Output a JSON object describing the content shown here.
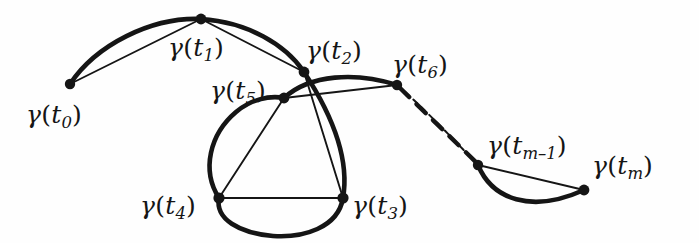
{
  "figure": {
    "name": "polygonal-approximation-of-a-curve",
    "background_color": "#fefefe",
    "ink_color": "#151515",
    "width": 699,
    "height": 243
  },
  "labels": [
    {
      "key": "t0",
      "text": "γ(t₀)",
      "gamma": "γ",
      "open": "(",
      "t": "t",
      "sub": "0",
      "close": ")",
      "x": 26,
      "y": 102,
      "size": 25
    },
    {
      "key": "t1",
      "text": "γ(t₁)",
      "gamma": "γ",
      "open": "(",
      "t": "t",
      "sub": "1",
      "close": ")",
      "x": 168,
      "y": 35,
      "size": 25
    },
    {
      "key": "t2",
      "text": "γ(t₂)",
      "gamma": "γ",
      "open": "(",
      "t": "t",
      "sub": "2",
      "close": ")",
      "x": 306,
      "y": 38,
      "size": 25
    },
    {
      "key": "t5",
      "text": "γ(t₅)",
      "gamma": "γ",
      "open": "(",
      "t": "t",
      "sub": "5",
      "close": ")",
      "x": 210,
      "y": 78,
      "size": 25
    },
    {
      "key": "t6",
      "text": "γ(t₆)",
      "gamma": "γ",
      "open": "(",
      "t": "t",
      "sub": "6",
      "close": ")",
      "x": 392,
      "y": 52,
      "size": 25
    },
    {
      "key": "tm1",
      "text": "γ(tₘ₋₁)",
      "gamma": "γ",
      "open": "(",
      "t": "t",
      "sub": "m–1",
      "close": ")",
      "x": 487,
      "y": 133,
      "size": 25
    },
    {
      "key": "tm",
      "text": "γ(tₘ)",
      "gamma": "γ",
      "open": "(",
      "t": "t",
      "sub": "m",
      "close": ")",
      "x": 592,
      "y": 153,
      "size": 25
    },
    {
      "key": "t4",
      "text": "γ(t₄)",
      "gamma": "γ",
      "open": "(",
      "t": "t",
      "sub": "4",
      "close": ")",
      "x": 140,
      "y": 193,
      "size": 25
    },
    {
      "key": "t3",
      "text": "γ(t₃)",
      "gamma": "γ",
      "open": "(",
      "t": "t",
      "sub": "3",
      "close": ")",
      "x": 352,
      "y": 193,
      "size": 25
    }
  ],
  "nodes": [
    {
      "key": "t0",
      "x": 70,
      "y": 84,
      "r": 5.2
    },
    {
      "key": "t1",
      "x": 201,
      "y": 19,
      "r": 5.4
    },
    {
      "key": "t2",
      "x": 304,
      "y": 72,
      "r": 5.4
    },
    {
      "key": "t5",
      "x": 284,
      "y": 98,
      "r": 5.4
    },
    {
      "key": "t6",
      "x": 397,
      "y": 85,
      "r": 5.2
    },
    {
      "key": "tm1",
      "x": 478,
      "y": 165,
      "r": 5.2
    },
    {
      "key": "tm",
      "x": 584,
      "y": 190,
      "r": 5.4
    },
    {
      "key": "t4",
      "x": 219,
      "y": 198,
      "r": 5.6
    },
    {
      "key": "t3",
      "x": 343,
      "y": 198,
      "r": 5.6
    }
  ],
  "arcs": [
    {
      "key": "arc-t0-t1",
      "from": "t0",
      "to": "t1",
      "style": "solid-thick"
    },
    {
      "key": "arc-t1-t2",
      "from": "t1",
      "to": "t2",
      "style": "solid-thick"
    },
    {
      "key": "arc-t2-t3",
      "from": "t2",
      "to": "t3",
      "style": "solid-thick"
    },
    {
      "key": "arc-t3-t4",
      "from": "t3",
      "to": "t4",
      "style": "solid-thick"
    },
    {
      "key": "arc-t4-t5",
      "from": "t4",
      "to": "t5",
      "style": "solid-thick"
    },
    {
      "key": "arc-t5-t6",
      "from": "t5",
      "to": "t6",
      "style": "solid-thick"
    },
    {
      "key": "arc-t6-tm1",
      "from": "t6",
      "to": "tm1",
      "style": "dotted-thin"
    },
    {
      "key": "arc-tm1-tm",
      "from": "tm1",
      "to": "tm",
      "style": "solid-thick"
    }
  ],
  "chords": [
    {
      "key": "chord-t0-t1",
      "from": "t0",
      "to": "t1",
      "style": "solid-thin"
    },
    {
      "key": "chord-t1-t2",
      "from": "t1",
      "to": "t2",
      "style": "solid-thin"
    },
    {
      "key": "chord-t2-t3",
      "from": "t2",
      "to": "t3",
      "style": "solid-thin"
    },
    {
      "key": "chord-t3-t4",
      "from": "t3",
      "to": "t4",
      "style": "solid-thin"
    },
    {
      "key": "chord-t4-t5",
      "from": "t4",
      "to": "t5",
      "style": "solid-thin"
    },
    {
      "key": "chord-t5-t6",
      "from": "t5",
      "to": "t6",
      "style": "solid-thin"
    },
    {
      "key": "chord-t6-tm1",
      "from": "t6",
      "to": "tm1",
      "style": "dashed-thick"
    },
    {
      "key": "chord-tm1-tm",
      "from": "tm1",
      "to": "tm",
      "style": "solid-thin"
    }
  ]
}
